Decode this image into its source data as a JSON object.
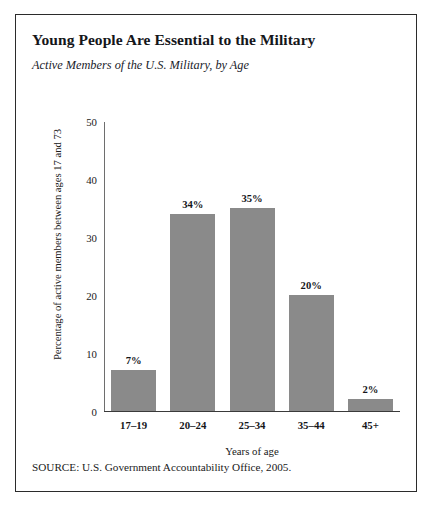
{
  "figure": {
    "title": "Young People Are Essential to the Military",
    "subtitle": "Active Members of the U.S. Military, by Age",
    "source_note": "SOURCE: U.S. Government Accountability Office, 2005.",
    "frame_color": "#2b2b2b",
    "bar_color": "#8a8a8a"
  },
  "chart_data": {
    "type": "bar",
    "title": "Young People Are Essential to the Military",
    "subtitle": "Active Members of the U.S. Military, by Age",
    "xlabel": "Years of age",
    "ylabel": "Percentage of active members between ages 17 and 73",
    "categories": [
      "17–19",
      "20–24",
      "25–34",
      "35–44",
      "45+"
    ],
    "values": [
      7,
      34,
      35,
      20,
      2
    ],
    "data_labels": [
      "7%",
      "34%",
      "35%",
      "20%",
      "2%"
    ],
    "ylim": [
      0,
      50
    ],
    "yticks": [
      0,
      10,
      20,
      30,
      40,
      50
    ],
    "ytick_labels": [
      "0",
      "10",
      "20",
      "30",
      "40",
      "50"
    ],
    "grid": false,
    "legend": false,
    "bar_color": "#8a8a8a",
    "source": "SOURCE: U.S. Government Accountability Office, 2005."
  }
}
